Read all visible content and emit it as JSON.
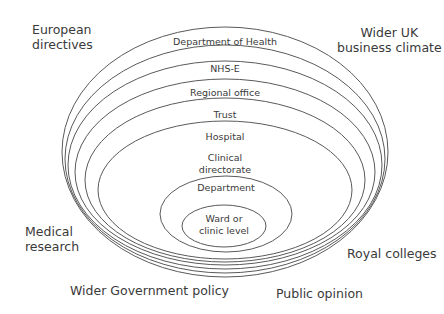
{
  "diagram": {
    "type": "nested-ellipses",
    "stroke_color": "#5a5a5a",
    "text_color": "#3a3a3a",
    "rings": [
      {
        "label": "Department of Health",
        "lines": [
          "Department of Health"
        ],
        "cx": 225,
        "cy": 152,
        "rx": 163,
        "ry": 125,
        "label_y": [
          45
        ]
      },
      {
        "label": "NHS-E",
        "lines": [
          "NHS-E"
        ],
        "cx": 225,
        "cy": 159,
        "rx": 160,
        "ry": 114,
        "label_y": [
          72
        ]
      },
      {
        "label": "Regional office",
        "lines": [
          "Regional office"
        ],
        "cx": 225,
        "cy": 165,
        "rx": 157,
        "ry": 104,
        "label_y": [
          96
        ]
      },
      {
        "label": "Trust",
        "lines": [
          "Trust"
        ],
        "cx": 225,
        "cy": 172,
        "rx": 150,
        "ry": 93,
        "label_y": [
          118
        ]
      },
      {
        "label": "Hospital",
        "lines": [
          "Hospital"
        ],
        "cx": 225,
        "cy": 180,
        "rx": 140,
        "ry": 82,
        "label_y": [
          140
        ]
      },
      {
        "label": "Clinical directorate",
        "lines": [
          "Clinical",
          "directorate"
        ],
        "cx": 225,
        "cy": 190,
        "rx": 127,
        "ry": 69,
        "label_y": [
          161,
          173
        ]
      },
      {
        "label": "Department",
        "lines": [
          "Department"
        ],
        "cx": 226,
        "cy": 214,
        "rx": 66,
        "ry": 38,
        "label_y": [
          191
        ]
      },
      {
        "label": "Ward or clinic level",
        "lines": [
          "Ward or",
          "clinic level"
        ],
        "cx": 224,
        "cy": 226,
        "rx": 42,
        "ry": 21,
        "label_y": [
          222,
          234
        ]
      }
    ],
    "external_factors": [
      {
        "id": "european-directives",
        "text": "European\ndirectives",
        "x": 32,
        "y": 22,
        "align": "left"
      },
      {
        "id": "wider-uk-business-climate",
        "text": "Wider UK\nbusiness climate",
        "x": 337,
        "y": 25,
        "align": "center"
      },
      {
        "id": "medical-research",
        "text": "Medical\nresearch",
        "x": 25,
        "y": 224,
        "align": "left"
      },
      {
        "id": "royal-colleges",
        "text": "Royal colleges",
        "x": 347,
        "y": 246,
        "align": "left"
      },
      {
        "id": "wider-government-policy",
        "text": "Wider Government policy",
        "x": 70,
        "y": 283,
        "align": "left"
      },
      {
        "id": "public-opinion",
        "text": "Public opinion",
        "x": 276,
        "y": 286,
        "align": "left"
      }
    ]
  }
}
